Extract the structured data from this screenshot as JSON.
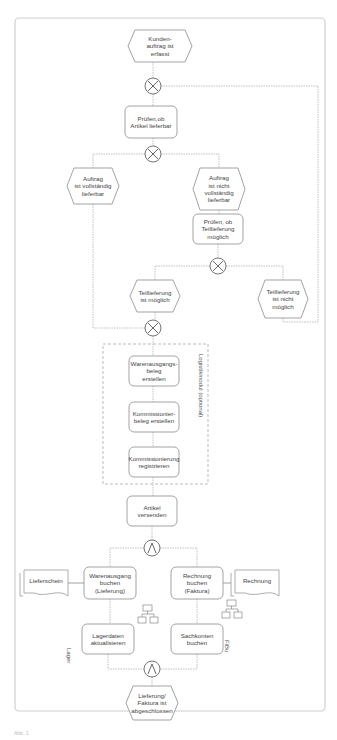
{
  "diagram": {
    "type": "EPC (Ereignisgesteuerte Prozesskette)",
    "frame": {
      "x": 15,
      "y": 18,
      "w": 310,
      "h": 693
    },
    "colors": {
      "line": "#9a9a9a",
      "connector": "#b0b0b0",
      "frame": "#cfcfcf",
      "text": "#444444"
    },
    "events": [
      {
        "id": "e1",
        "label": "Kunden-\nauftrag ist\nerfasst",
        "x": 128,
        "y": 30,
        "w": 64,
        "h": 32
      },
      {
        "id": "e2",
        "label": "Auftrag\nist vollständig\nlieferbar",
        "x": 67,
        "y": 168,
        "w": 52,
        "h": 36
      },
      {
        "id": "e3",
        "label": "Auftrag\nist nicht\nvollständig\nlieferbar",
        "x": 193,
        "y": 168,
        "w": 52,
        "h": 42
      },
      {
        "id": "e4",
        "label": "Teillieferung\nist möglich",
        "x": 130,
        "y": 280,
        "w": 50,
        "h": 32
      },
      {
        "id": "e5",
        "label": "Teillieferung\nist nicht möglich",
        "x": 258,
        "y": 280,
        "w": 50,
        "h": 38
      },
      {
        "id": "e6",
        "label": "Lieferung/\nFaktura ist\nabgeschlossen",
        "x": 126,
        "y": 698,
        "w": 52,
        "h": 0
      }
    ],
    "functions": [
      {
        "id": "f1",
        "label": "Prüfen,ob\nArtikel  lieferbar",
        "x": 125,
        "y": 106,
        "w": 52,
        "h": 32
      },
      {
        "id": "f2",
        "label": "Prüfen, ob\nTeillieferung\nmöglich",
        "x": 193,
        "y": 214,
        "w": 50,
        "h": 30
      },
      {
        "id": "f3",
        "label": "Warenausgangs-\nbeleg\nerstellen",
        "x": 129,
        "y": 356,
        "w": 50,
        "h": 30
      },
      {
        "id": "f4",
        "label": "Kommissionier-\nbeleg erstellen",
        "x": 129,
        "y": 402,
        "w": 50,
        "h": 30
      },
      {
        "id": "f5",
        "label": "Kommissionierung\nregistrieren",
        "x": 129,
        "y": 447,
        "w": 50,
        "h": 30
      },
      {
        "id": "f6",
        "label": "Artikel\nversenden",
        "x": 127,
        "y": 496,
        "w": 50,
        "h": 30
      },
      {
        "id": "f7",
        "label": "Warenausgang\nbuchen\n(Lieferung)",
        "x": 84,
        "y": 567,
        "w": 52,
        "h": 32
      },
      {
        "id": "f8",
        "label": "Rechnung\nbuchen\n(Faktura)",
        "x": 171,
        "y": 567,
        "w": 52,
        "h": 32
      },
      {
        "id": "f9",
        "label": "Lagerdaten\naktualisieren",
        "x": 82,
        "y": 624,
        "w": 52,
        "h": 30
      },
      {
        "id": "f10",
        "label": "Sachkonten\nbuchen",
        "x": 171,
        "y": 624,
        "w": 52,
        "h": 30
      }
    ],
    "connectors": [
      {
        "id": "c1",
        "type": "XOR",
        "cx": 153,
        "cy": 86,
        "r": 8
      },
      {
        "id": "c2",
        "type": "XOR",
        "cx": 153,
        "cy": 154,
        "r": 8
      },
      {
        "id": "c3",
        "type": "XOR",
        "cx": 218,
        "cy": 266,
        "r": 8
      },
      {
        "id": "c4",
        "type": "XOR",
        "cx": 153,
        "cy": 328,
        "r": 8
      },
      {
        "id": "c5",
        "type": "AND",
        "cx": 152,
        "cy": 548,
        "r": 8
      },
      {
        "id": "c6",
        "type": "AND",
        "cx": 152,
        "cy": 669,
        "r": 8
      }
    ],
    "documents": [
      {
        "id": "d1",
        "label": "Lieferschein",
        "x": 20,
        "y": 570,
        "w": 48,
        "h": 26
      },
      {
        "id": "d2",
        "label": "Rechnung",
        "x": 231,
        "y": 570,
        "w": 48,
        "h": 26
      }
    ],
    "org_units": [
      {
        "id": "o1",
        "label": "Lager",
        "x": 72,
        "y": 648
      },
      {
        "id": "o2",
        "label": "FiBu",
        "x": 230,
        "y": 640
      }
    ],
    "system_icons": [
      {
        "id": "s1",
        "x": 138,
        "y": 605
      },
      {
        "id": "s2",
        "x": 222,
        "y": 600
      }
    ],
    "module_box": {
      "label": "Logistikmodul (optional)",
      "x": 103,
      "y": 344,
      "w": 105,
      "h": 140
    },
    "caption": "Abb. 1"
  }
}
